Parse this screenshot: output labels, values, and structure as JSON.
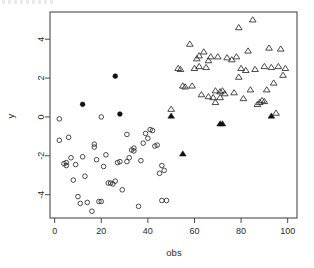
{
  "figure": {
    "kind": "scatter-plot",
    "background": "#ffffff",
    "frame_color": "#4a4a4a"
  },
  "chart_data": {
    "type": "scatter",
    "title": "",
    "xlabel": "obs",
    "ylabel": "y",
    "xlim": [
      -2,
      104
    ],
    "ylim": [
      -5.2,
      5.4
    ],
    "xticks": [
      0,
      20,
      40,
      60,
      80,
      100
    ],
    "xticklabels": [
      "0",
      "20",
      "40",
      "60",
      "80",
      "100"
    ],
    "yticks": [
      -4,
      -2,
      0,
      2,
      4
    ],
    "yticklabels": [
      "-4",
      "-2",
      "0",
      "2",
      "4"
    ],
    "grid": false,
    "legend": "none",
    "series": [
      {
        "name": "open-circle",
        "marker": "circle-open",
        "color": "#2b2b2b",
        "filled": false,
        "points": [
          [
            2,
            -0.1
          ],
          [
            2,
            -1.2
          ],
          [
            4,
            -2.4
          ],
          [
            5,
            -2.5
          ],
          [
            5,
            -2.35
          ],
          [
            6,
            -1.05
          ],
          [
            7,
            -2.1
          ],
          [
            8,
            -3.25
          ],
          [
            9,
            -2.45
          ],
          [
            10,
            -4.1
          ],
          [
            11,
            -4.45
          ],
          [
            12,
            -2.05
          ],
          [
            13,
            -3.05
          ],
          [
            14,
            -4.4
          ],
          [
            16,
            -4.85
          ],
          [
            17,
            -1.4
          ],
          [
            17,
            -1.55
          ],
          [
            18,
            -2.2
          ],
          [
            19,
            -4.35
          ],
          [
            20,
            0.0
          ],
          [
            20,
            -4.35
          ],
          [
            21,
            -2.55
          ],
          [
            22,
            -1.95
          ],
          [
            23,
            -3.4
          ],
          [
            24,
            -3.4
          ],
          [
            25,
            -3.45
          ],
          [
            26,
            -3.3
          ],
          [
            27,
            -2.35
          ],
          [
            28,
            -2.3
          ],
          [
            29,
            -3.75
          ],
          [
            31,
            -2.3
          ],
          [
            31,
            -0.9
          ],
          [
            32,
            -2.1
          ],
          [
            33,
            -1.7
          ],
          [
            34,
            -1.6
          ],
          [
            34,
            -1.75
          ],
          [
            36,
            -4.6
          ],
          [
            37,
            -2.25
          ],
          [
            38,
            -1.35
          ],
          [
            39,
            -0.85
          ],
          [
            40,
            -1.1
          ],
          [
            41,
            -0.65
          ],
          [
            42,
            -0.7
          ],
          [
            43,
            -1.5
          ],
          [
            44,
            -1.45
          ],
          [
            45,
            -2.9
          ],
          [
            46,
            -2.5
          ],
          [
            46,
            -4.3
          ],
          [
            47,
            -2.75
          ],
          [
            48,
            -4.3
          ]
        ]
      },
      {
        "name": "filled-circle",
        "marker": "circle-filled",
        "color": "#111111",
        "filled": true,
        "points": [
          [
            12,
            0.65
          ],
          [
            26,
            2.1
          ],
          [
            28,
            0.15
          ]
        ]
      },
      {
        "name": "open-triangle",
        "marker": "triangle-open",
        "color": "#2b2b2b",
        "filled": false,
        "points": [
          [
            50,
            0.4
          ],
          [
            53,
            2.5
          ],
          [
            54,
            2.45
          ],
          [
            55,
            1.6
          ],
          [
            56,
            1.55
          ],
          [
            58,
            3.75
          ],
          [
            59,
            1.6
          ],
          [
            60,
            2.5
          ],
          [
            61,
            3.0
          ],
          [
            62,
            2.6
          ],
          [
            63,
            1.15
          ],
          [
            64,
            3.35
          ],
          [
            65,
            2.55
          ],
          [
            66,
            1.05
          ],
          [
            67,
            3.1
          ],
          [
            68,
            1.0
          ],
          [
            69,
            1.35
          ],
          [
            69,
            0.75
          ],
          [
            70,
            3.1
          ],
          [
            71,
            1.3
          ],
          [
            72,
            1.35
          ],
          [
            73,
            1.2
          ],
          [
            74,
            3.05
          ],
          [
            76,
            2.95
          ],
          [
            77,
            1.25
          ],
          [
            78,
            3.1
          ],
          [
            79,
            2.05
          ],
          [
            80,
            2.5
          ],
          [
            81,
            0.95
          ],
          [
            82,
            2.4
          ],
          [
            83,
            3.4
          ],
          [
            84,
            1.4
          ],
          [
            85,
            5.0
          ],
          [
            86,
            2.45
          ],
          [
            87,
            0.65
          ],
          [
            88,
            0.75
          ],
          [
            89,
            0.85
          ],
          [
            90,
            0.8
          ],
          [
            90,
            2.6
          ],
          [
            91,
            1.4
          ],
          [
            92,
            3.55
          ],
          [
            93,
            2.55
          ],
          [
            94,
            1.75
          ],
          [
            95,
            0.2
          ],
          [
            96,
            2.6
          ],
          [
            97,
            3.5
          ],
          [
            98,
            2.15
          ],
          [
            99,
            2.5
          ],
          [
            79,
            4.6
          ],
          [
            71,
            1.0
          ],
          [
            66,
            2.9
          ],
          [
            62,
            3.15
          ]
        ]
      },
      {
        "name": "filled-triangle",
        "marker": "triangle-filled",
        "color": "#111111",
        "filled": true,
        "points": [
          [
            50,
            0.05
          ],
          [
            55,
            -1.9
          ],
          [
            71,
            -0.35
          ],
          [
            72,
            -0.35
          ],
          [
            93,
            0.05
          ]
        ]
      }
    ]
  }
}
